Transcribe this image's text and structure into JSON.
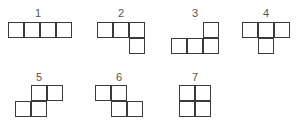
{
  "diagram": {
    "cell_size": 16,
    "line_color": "#3a3a3a",
    "label_color": "#555555",
    "shapes": [
      {
        "label": "1",
        "label_pos": [
          38,
          7
        ],
        "origin": [
          8,
          22
        ],
        "cells": [
          [
            0,
            0
          ],
          [
            1,
            0
          ],
          [
            2,
            0
          ],
          [
            3,
            0
          ]
        ]
      },
      {
        "label": "2",
        "label_pos": [
          121,
          7
        ],
        "origin": [
          97,
          22
        ],
        "cells": [
          [
            0,
            0
          ],
          [
            1,
            0
          ],
          [
            2,
            0
          ],
          [
            2,
            1
          ]
        ]
      },
      {
        "label": "3",
        "label_pos": [
          195,
          7
        ],
        "origin": [
          171,
          22
        ],
        "cells": [
          [
            2,
            0
          ],
          [
            0,
            1
          ],
          [
            1,
            1
          ],
          [
            2,
            1
          ]
        ]
      },
      {
        "label": "4",
        "label_pos": [
          266,
          7
        ],
        "origin": [
          242,
          22
        ],
        "cells": [
          [
            0,
            0
          ],
          [
            1,
            0
          ],
          [
            2,
            0
          ],
          [
            1,
            1
          ]
        ]
      },
      {
        "label": "5",
        "label_pos": [
          39,
          71
        ],
        "origin": [
          15,
          85
        ],
        "cells": [
          [
            1,
            0
          ],
          [
            2,
            0
          ],
          [
            0,
            1
          ],
          [
            1,
            1
          ]
        ]
      },
      {
        "label": "6",
        "label_pos": [
          119,
          71
        ],
        "origin": [
          95,
          85
        ],
        "cells": [
          [
            0,
            0
          ],
          [
            1,
            0
          ],
          [
            1,
            1
          ],
          [
            2,
            1
          ]
        ]
      },
      {
        "label": "7",
        "label_pos": [
          195,
          71
        ],
        "origin": [
          179,
          85
        ],
        "cells": [
          [
            0,
            0
          ],
          [
            1,
            0
          ],
          [
            0,
            1
          ],
          [
            1,
            1
          ]
        ]
      }
    ]
  }
}
